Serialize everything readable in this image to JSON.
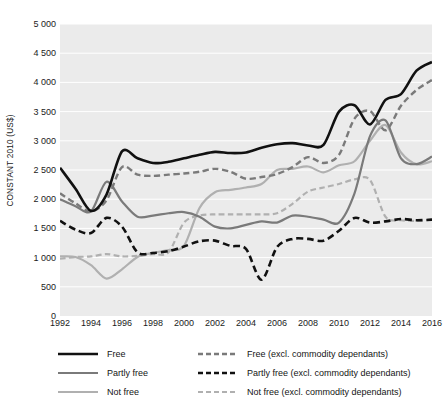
{
  "chart_data": {
    "type": "line",
    "title": "",
    "xlabel": "",
    "ylabel": "CONSTANT 2010 (US$)",
    "xlim": [
      1992,
      2016
    ],
    "ylim": [
      0,
      5000
    ],
    "grid": true,
    "legend_position": "bottom",
    "x": [
      1992,
      1993,
      1994,
      1995,
      1996,
      1997,
      1998,
      1999,
      2000,
      2001,
      2002,
      2003,
      2004,
      2005,
      2006,
      2007,
      2008,
      2009,
      2010,
      2011,
      2012,
      2013,
      2014,
      2015,
      2016
    ],
    "x_tick_labels": [
      "1992",
      "1994",
      "1996",
      "1998",
      "2000",
      "2002",
      "2004",
      "2006",
      "2008",
      "2010",
      "2012",
      "2014",
      "2016"
    ],
    "y_tick_labels": [
      "0",
      "500",
      "1 000",
      "1 500",
      "2 000",
      "2 500",
      "3 000",
      "3 500",
      "4 000",
      "4 500",
      "5 000"
    ],
    "y_ticks": [
      0,
      500,
      1000,
      1500,
      2000,
      2500,
      3000,
      3500,
      4000,
      4500,
      5000
    ],
    "series": [
      {
        "name": "Free",
        "color": "#111111",
        "style": "solid",
        "width": 2.6,
        "values": [
          2540,
          2180,
          1800,
          2080,
          2820,
          2700,
          2620,
          2640,
          2700,
          2760,
          2810,
          2790,
          2800,
          2880,
          2940,
          2960,
          2920,
          2930,
          3500,
          3610,
          3280,
          3700,
          3800,
          4200,
          4350
        ]
      },
      {
        "name": "Partly free",
        "color": "#7a7a7a",
        "style": "solid",
        "width": 2.2,
        "values": [
          2000,
          1880,
          1790,
          2300,
          1960,
          1700,
          1720,
          1760,
          1780,
          1700,
          1530,
          1500,
          1560,
          1620,
          1600,
          1720,
          1700,
          1650,
          1600,
          2100,
          3080,
          3350,
          2700,
          2600,
          2730
        ]
      },
      {
        "name": "Not free",
        "color": "#b0b0b0",
        "style": "solid",
        "width": 2.2,
        "values": [
          1020,
          1010,
          870,
          640,
          800,
          1010,
          1080,
          1130,
          1200,
          1850,
          2120,
          2160,
          2200,
          2260,
          2500,
          2520,
          2560,
          2460,
          2580,
          2650,
          3000,
          3270,
          2800,
          2600,
          2650
        ]
      },
      {
        "name": "Free (excl. commodity dependants)",
        "color": "#7a7a7a",
        "style": "dashed",
        "width": 2.4,
        "values": [
          2100,
          1930,
          1790,
          1980,
          2550,
          2420,
          2400,
          2420,
          2440,
          2470,
          2520,
          2470,
          2350,
          2380,
          2430,
          2550,
          2720,
          2620,
          2760,
          3380,
          3510,
          3180,
          3600,
          3870,
          4040
        ]
      },
      {
        "name": "Partly free (excl. commodity dependants)",
        "color": "#111111",
        "style": "dashed",
        "width": 2.6,
        "values": [
          1630,
          1480,
          1420,
          1680,
          1530,
          1090,
          1080,
          1110,
          1190,
          1280,
          1290,
          1200,
          1150,
          620,
          1180,
          1320,
          1320,
          1290,
          1460,
          1680,
          1600,
          1620,
          1660,
          1640,
          1650
        ]
      },
      {
        "name": "Not free (excl. commodity dependants)",
        "color": "#b0b0b0",
        "style": "dashed",
        "width": 2.2,
        "values": [
          980,
          1010,
          1020,
          1060,
          1020,
          1030,
          1060,
          1090,
          1600,
          1720,
          1740,
          1740,
          1740,
          1740,
          1760,
          1920,
          2130,
          2200,
          2260,
          2340,
          2330,
          1700,
          1640,
          1630,
          1650
        ]
      }
    ]
  },
  "axis": {
    "y_title": "CONSTANT 2010 (US$)"
  },
  "legend": {
    "items": [
      {
        "label": "Free",
        "series": "Free"
      },
      {
        "label": "Partly free",
        "series": "Partly free"
      },
      {
        "label": "Not free",
        "series": "Not free"
      },
      {
        "label": "Free (excl. commodity dependants)",
        "series": "Free (excl. commodity dependants)"
      },
      {
        "label": "Partly free (excl. commodity dependants)",
        "series": "Partly free (excl. commodity dependants)"
      },
      {
        "label": "Not free (excl. commodity dependants)",
        "series": "Not free (excl. commodity dependants)"
      }
    ]
  },
  "colors": {
    "plot_background": "#ebebeb",
    "gridline": "#ffffff",
    "black": "#111111",
    "mid_gray": "#7a7a7a",
    "light_gray": "#b0b0b0"
  }
}
